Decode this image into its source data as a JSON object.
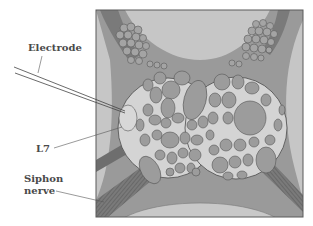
{
  "figure": {
    "labels": {
      "electrode": "Electrode",
      "l7": "L7",
      "siphon_nerve_line1": "Siphon",
      "siphon_nerve_line2": "nerve"
    },
    "colors": {
      "background": "#ffffff",
      "frame_border": "#5a5a5a",
      "outer_light": "#c6c6c6",
      "connective": "#9a9a9a",
      "ganglion_fill": "#d4d4d4",
      "neuron_fill": "#9c9c9c",
      "neuron_outline": "#555555",
      "l7_fill": "#d8d8d8",
      "nerve_dark": "#6e6e6e",
      "label_text": "#4a4a4a",
      "leader_line": "#555555"
    }
  }
}
